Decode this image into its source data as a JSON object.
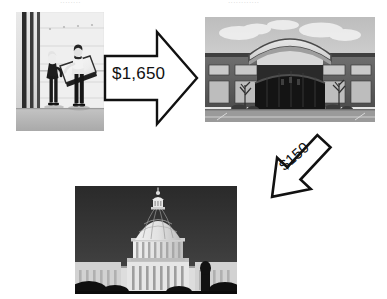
{
  "canvas": {
    "width": 387,
    "height": 299,
    "background": "#ffffff"
  },
  "top_fragments": {
    "left": "........",
    "right": "............"
  },
  "flow": {
    "title": "",
    "nodes": [
      {
        "id": "movers",
        "name": "delivery-photo",
        "caption": "Two people carrying a large flat boxed item indoors",
        "type": "photo",
        "tone": "black-and-white"
      },
      {
        "id": "store",
        "name": "retail-store-photo",
        "caption": "Brick commercial retail building with curved arched roofline and dark glass entrance",
        "type": "photo",
        "tone": "black-and-white"
      },
      {
        "id": "capitol",
        "name": "capitol-photo",
        "caption": "United States Capitol dome",
        "type": "photo",
        "tone": "black-and-white"
      }
    ],
    "arrows": [
      {
        "id": "arrow-1",
        "name": "arrow-movers-to-store",
        "label": "$1,650",
        "direction": "right",
        "from": "movers",
        "to": "store",
        "stroke": "#111111",
        "fill": "#ffffff"
      },
      {
        "id": "arrow-2",
        "name": "arrow-store-to-capitol",
        "label": "$150",
        "direction": "down-left",
        "from": "store",
        "to": "capitol",
        "stroke": "#111111",
        "fill": "#ffffff"
      }
    ]
  },
  "colors": {
    "background": "#ffffff",
    "arrow_stroke": "#111111",
    "arrow_fill": "#ffffff",
    "label_text": "#111111"
  }
}
